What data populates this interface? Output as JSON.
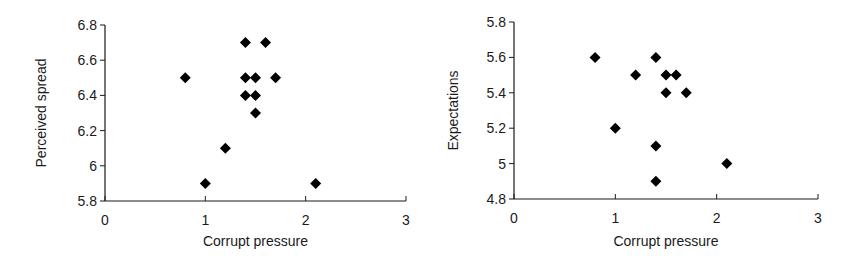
{
  "chart_data": [
    {
      "type": "scatter",
      "title": "",
      "xlabel": "Corrupt pressure",
      "ylabel": "Perceived spread",
      "xlim": [
        0,
        3
      ],
      "ylim": [
        5.8,
        6.8
      ],
      "xticks": [
        "0",
        "1",
        "2",
        "3"
      ],
      "yticks": [
        "5.8",
        "6",
        "6.2",
        "6.4",
        "6.6",
        "6.8"
      ],
      "grid": false,
      "legend": null,
      "marker": "diamond",
      "marker_color": "#000000",
      "points": [
        {
          "x": 0.8,
          "y": 6.5
        },
        {
          "x": 1.0,
          "y": 5.9
        },
        {
          "x": 1.2,
          "y": 6.1
        },
        {
          "x": 1.4,
          "y": 6.7
        },
        {
          "x": 1.6,
          "y": 6.7
        },
        {
          "x": 1.4,
          "y": 6.5
        },
        {
          "x": 1.5,
          "y": 6.5
        },
        {
          "x": 1.7,
          "y": 6.5
        },
        {
          "x": 1.4,
          "y": 6.4
        },
        {
          "x": 1.5,
          "y": 6.4
        },
        {
          "x": 1.5,
          "y": 6.3
        },
        {
          "x": 2.1,
          "y": 5.9
        }
      ]
    },
    {
      "type": "scatter",
      "title": "",
      "xlabel": "Corrupt pressure",
      "ylabel": "Expectations",
      "xlim": [
        0,
        3
      ],
      "ylim": [
        4.8,
        5.8
      ],
      "xticks": [
        "0",
        "1",
        "2",
        "3"
      ],
      "yticks": [
        "4.8",
        "5",
        "5.2",
        "5.4",
        "5.6",
        "5.8"
      ],
      "grid": false,
      "legend": null,
      "marker": "diamond",
      "marker_color": "#000000",
      "points": [
        {
          "x": 0.8,
          "y": 5.6
        },
        {
          "x": 1.4,
          "y": 5.6
        },
        {
          "x": 1.2,
          "y": 5.5
        },
        {
          "x": 1.5,
          "y": 5.5
        },
        {
          "x": 1.6,
          "y": 5.5
        },
        {
          "x": 1.5,
          "y": 5.4
        },
        {
          "x": 1.7,
          "y": 5.4
        },
        {
          "x": 1.0,
          "y": 5.2
        },
        {
          "x": 1.4,
          "y": 5.1
        },
        {
          "x": 2.1,
          "y": 5.0
        },
        {
          "x": 1.4,
          "y": 4.9
        }
      ]
    }
  ],
  "layout": [
    {
      "left": 0,
      "x0": 105,
      "x1": 406,
      "yTop": 25,
      "yBottom": 201,
      "ylabelX": 46,
      "xlabelY": 246
    },
    {
      "left": 429,
      "x0": 85,
      "x1": 389,
      "yTop": 22,
      "yBottom": 199,
      "ylabelX": 29,
      "xlabelY": 246
    }
  ],
  "colors": {
    "axis": "#1a1a1a",
    "marker": "#000000",
    "background": "#ffffff"
  }
}
